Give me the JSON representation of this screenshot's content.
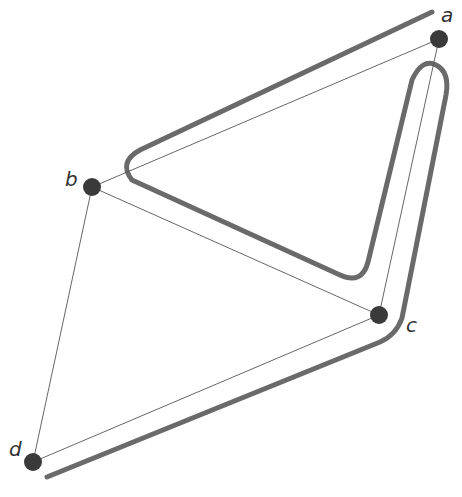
{
  "diagram": {
    "type": "graph-with-path",
    "nodes": [
      {
        "id": "a",
        "label": "a",
        "x": 439,
        "y": 39
      },
      {
        "id": "b",
        "label": "b",
        "x": 92,
        "y": 187
      },
      {
        "id": "c",
        "label": "c",
        "x": 379,
        "y": 315
      },
      {
        "id": "d",
        "label": "d",
        "x": 33,
        "y": 462
      }
    ],
    "edges": [
      {
        "from": "a",
        "to": "b"
      },
      {
        "from": "a",
        "to": "c"
      },
      {
        "from": "b",
        "to": "c"
      },
      {
        "from": "b",
        "to": "d"
      },
      {
        "from": "c",
        "to": "d"
      }
    ],
    "thick_path_description": "Rounded walk path tracing a→b→c→a→c→d, drawn as a thick gray line offset from the edges",
    "colors": {
      "node": "#3a3a3a",
      "edge": "#555555",
      "path": "#6a6a6a",
      "background": "#ffffff"
    }
  }
}
